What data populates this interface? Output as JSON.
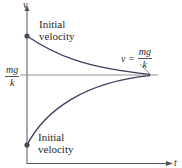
{
  "diagram": {
    "axes": {
      "y_label": "v",
      "x_label": "t"
    },
    "asymptote": {
      "left_label_numerator": "mg",
      "left_label_denominator": "k",
      "right_label_prefix": "v =",
      "right_label_numerator": "mg",
      "right_label_denominator": "k"
    },
    "curves": [
      {
        "name": "upper",
        "label_line1": "Initial",
        "label_line2": "velocity",
        "behavior": "decreasing toward mg/k"
      },
      {
        "name": "lower",
        "label_line1": "Initial",
        "label_line2": "velocity",
        "behavior": "increasing toward mg/k"
      }
    ],
    "colors": {
      "axis": "#555555",
      "curve": "#3a3d5c",
      "dot": "#4a4a55",
      "text": "#2a2a2a"
    }
  }
}
